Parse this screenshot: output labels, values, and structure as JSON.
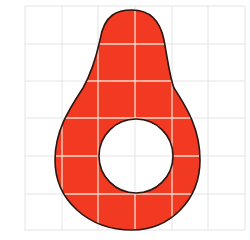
{
  "diagram": {
    "fill_color": "#f23a22",
    "outline_color": "#2a1510",
    "grid_color": "#e4e4e4",
    "grid_on_shape_color": "#f7d9c9",
    "grid": {
      "x_lines": [
        25,
        62,
        98,
        135,
        172,
        208,
        245
      ],
      "y_lines": [
        6,
        44,
        81,
        118,
        156,
        194,
        230
      ]
    },
    "hole": {
      "cx": 136,
      "cy": 156,
      "r": 37
    }
  }
}
